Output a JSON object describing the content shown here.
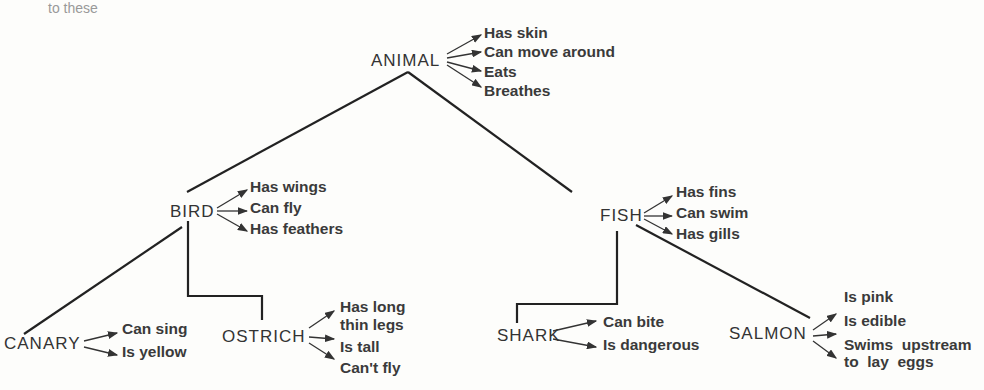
{
  "top_fragment": "to these",
  "nodes": {
    "animal": {
      "label": "ANIMAL",
      "properties": [
        "Has skin",
        "Can move around",
        "Eats",
        "Breathes"
      ]
    },
    "bird": {
      "label": "BIRD",
      "properties": [
        "Has wings",
        "Can fly",
        "Has feathers"
      ]
    },
    "fish": {
      "label": "FISH",
      "properties": [
        "Has fins",
        "Can swim",
        "Has gills"
      ]
    },
    "canary": {
      "label": "CANARY",
      "properties": [
        "Can sing",
        "Is yellow"
      ]
    },
    "ostrich": {
      "label": "OSTRICH",
      "properties": [
        "Has long",
        "thin legs",
        "Is tall",
        "Can't fly"
      ]
    },
    "shark": {
      "label": "SHARK",
      "properties": [
        "Can bite",
        "Is dangerous"
      ]
    },
    "salmon": {
      "label": "SALMON",
      "properties": [
        "Is pink",
        "Is edible",
        "Swims  upstream",
        "to  lay  eggs"
      ]
    }
  }
}
